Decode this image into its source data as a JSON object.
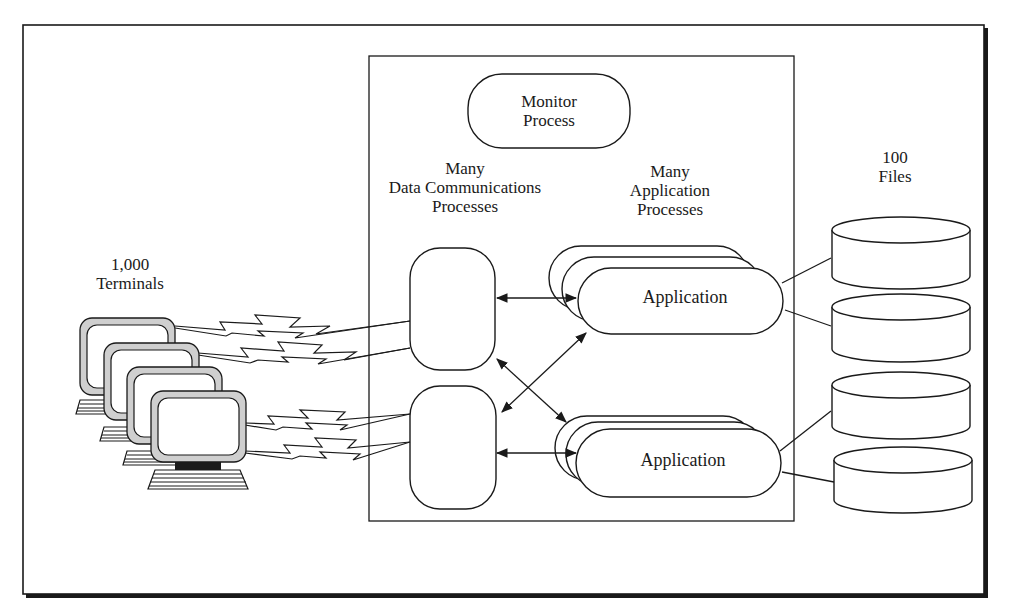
{
  "diagram": {
    "colors": {
      "ink": "#1a1a1a",
      "paper": "#ffffff",
      "bezel": "#cfcfcf"
    },
    "monitor_process": {
      "line1": "Monitor",
      "line2": "Process"
    },
    "data_comm": {
      "line1": "Many",
      "line2": "Data Communications",
      "line3": "Processes"
    },
    "app_processes": {
      "line1": "Many",
      "line2": "Application",
      "line3": "Processes"
    },
    "terminals": {
      "line1": "1,000",
      "line2": "Terminals",
      "count_drawn": 4,
      "icon": "computer-terminal-icon"
    },
    "files": {
      "line1": "100",
      "line2": "Files",
      "count_drawn": 4,
      "icon": "disk-cylinder-icon"
    },
    "applications": [
      {
        "label": "Application"
      },
      {
        "label": "Application"
      }
    ]
  }
}
